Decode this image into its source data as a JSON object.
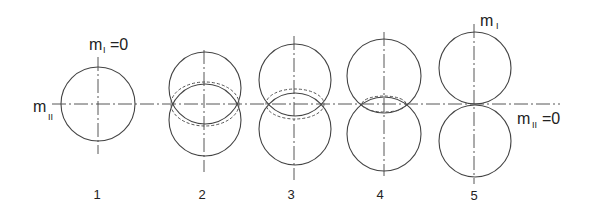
{
  "figure": {
    "labels": {
      "m1_zero": "m",
      "m1_zero_sub": "I",
      "m1_zero_eq": "=0",
      "m2_left": "m",
      "m2_left_sub": "II",
      "m1_right": "m",
      "m1_right_sub": "I",
      "m2_zero": "m",
      "m2_zero_sub": "II",
      "m2_zero_eq": "=0"
    },
    "stages": [
      {
        "number": "1",
        "type": "single-circle"
      },
      {
        "number": "2",
        "type": "two-overlapping-circles-with-dashed-ellipse"
      },
      {
        "number": "3",
        "type": "two-overlapping-circles-with-dashed-ellipse"
      },
      {
        "number": "4",
        "type": "two-overlapping-circles-with-dashed-ellipse"
      },
      {
        "number": "5",
        "type": "two-tangent-circles"
      }
    ],
    "colors": {
      "line": "#444444",
      "background": "#ffffff"
    }
  }
}
